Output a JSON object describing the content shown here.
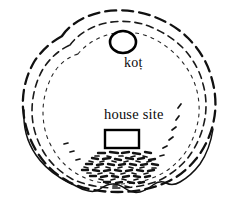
{
  "figure": {
    "type": "archaeological-site-plan",
    "background_color": "#ffffff",
    "ink_color": "#111111",
    "width": 235,
    "height": 210
  },
  "labels": {
    "kot": "koṭ",
    "house_site": "house site"
  },
  "features": [
    {
      "name": "kot-circle",
      "shape": "ellipse",
      "label": "koṭ",
      "cx": 123,
      "cy": 42,
      "rx": 13,
      "ry": 11
    },
    {
      "name": "house-site-rectangle",
      "shape": "rectangle",
      "label": "house site",
      "x": 105,
      "y": 130,
      "width": 34,
      "height": 18
    }
  ],
  "contours": [
    {
      "name": "outer-contour",
      "style": "heavy-dashed"
    },
    {
      "name": "middle-contour",
      "style": "medium-dashed"
    },
    {
      "name": "inner-contour",
      "style": "fine-dotted"
    },
    {
      "name": "base-line",
      "style": "solid-scalloped"
    }
  ],
  "debris_field": {
    "name": "rubble-scatter",
    "style": "scattered-dashes",
    "count": 96
  }
}
